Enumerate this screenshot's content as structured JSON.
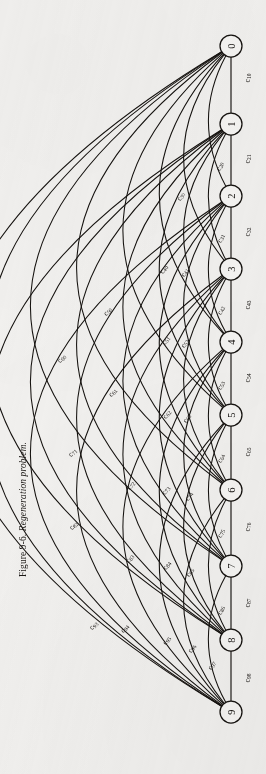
{
  "figure": {
    "caption_number": "Figure 9-6.",
    "caption_title": "Regeneration problem.",
    "type": "undirected-complete-graph",
    "node_count": 10,
    "edge_count": 45
  },
  "nodes": [
    {
      "id": "0",
      "label": "0",
      "x": 231,
      "y": 46
    },
    {
      "id": "1",
      "label": "1",
      "x": 231,
      "y": 124
    },
    {
      "id": "2",
      "label": "2",
      "x": 231,
      "y": 196
    },
    {
      "id": "3",
      "label": "3",
      "x": 231,
      "y": 269
    },
    {
      "id": "4",
      "label": "4",
      "x": 231,
      "y": 342
    },
    {
      "id": "5",
      "label": "5",
      "x": 231,
      "y": 415
    },
    {
      "id": "6",
      "label": "6",
      "x": 231,
      "y": 490
    },
    {
      "id": "7",
      "label": "7",
      "x": 231,
      "y": 566
    },
    {
      "id": "8",
      "label": "8",
      "x": 231,
      "y": 640
    },
    {
      "id": "9",
      "label": "9",
      "x": 231,
      "y": 712
    }
  ],
  "node_radius": 11,
  "edges": [
    {
      "label": "c",
      "sub": "10",
      "from": "1",
      "to": "0",
      "lx": 247,
      "ly": 78,
      "rot": -90,
      "bulge": 0
    },
    {
      "label": "c",
      "sub": "21",
      "from": "2",
      "to": "1",
      "lx": 247,
      "ly": 159,
      "rot": -90,
      "bulge": 0
    },
    {
      "label": "c",
      "sub": "20",
      "from": "2",
      "to": "0",
      "lx": 219,
      "ly": 166,
      "rot": -68,
      "bulge": 20
    },
    {
      "label": "c",
      "sub": "32",
      "from": "3",
      "to": "2",
      "lx": 247,
      "ly": 232,
      "rot": -90,
      "bulge": 0
    },
    {
      "label": "c",
      "sub": "31",
      "from": "3",
      "to": "1",
      "lx": 220,
      "ly": 238,
      "rot": -68,
      "bulge": 20
    },
    {
      "label": "c",
      "sub": "30",
      "from": "3",
      "to": "0",
      "lx": 180,
      "ly": 196,
      "rot": -58,
      "bulge": 44
    },
    {
      "label": "c",
      "sub": "43",
      "from": "4",
      "to": "3",
      "lx": 247,
      "ly": 305,
      "rot": -90,
      "bulge": 0
    },
    {
      "label": "c",
      "sub": "42",
      "from": "4",
      "to": "2",
      "lx": 220,
      "ly": 310,
      "rot": -68,
      "bulge": 20
    },
    {
      "label": "c",
      "sub": "41",
      "from": "4",
      "to": "1",
      "lx": 184,
      "ly": 272,
      "rot": -60,
      "bulge": 44
    },
    {
      "label": "c",
      "sub": "40",
      "from": "4",
      "to": "0",
      "lx": 163,
      "ly": 269,
      "rot": -56,
      "bulge": 68
    },
    {
      "label": "c",
      "sub": "54",
      "from": "5",
      "to": "4",
      "lx": 247,
      "ly": 378,
      "rot": -90,
      "bulge": 0
    },
    {
      "label": "c",
      "sub": "53",
      "from": "5",
      "to": "3",
      "lx": 220,
      "ly": 385,
      "rot": -68,
      "bulge": 20
    },
    {
      "label": "c",
      "sub": "52",
      "from": "5",
      "to": "2",
      "lx": 184,
      "ly": 343,
      "rot": -60,
      "bulge": 44
    },
    {
      "label": "c",
      "sub": "51",
      "from": "5",
      "to": "1",
      "lx": 165,
      "ly": 340,
      "rot": -56,
      "bulge": 68
    },
    {
      "label": "c",
      "sub": "50",
      "from": "5",
      "to": "0",
      "lx": 107,
      "ly": 311,
      "rot": -50,
      "bulge": 104
    },
    {
      "label": "c",
      "sub": "65",
      "from": "6",
      "to": "5",
      "lx": 247,
      "ly": 452,
      "rot": -90,
      "bulge": 0
    },
    {
      "label": "c",
      "sub": "64",
      "from": "6",
      "to": "4",
      "lx": 220,
      "ly": 458,
      "rot": -68,
      "bulge": 20
    },
    {
      "label": "c",
      "sub": "63",
      "from": "6",
      "to": "3",
      "lx": 186,
      "ly": 418,
      "rot": -60,
      "bulge": 44
    },
    {
      "label": "c",
      "sub": "62",
      "from": "6",
      "to": "2",
      "lx": 166,
      "ly": 414,
      "rot": -56,
      "bulge": 68
    },
    {
      "label": "c",
      "sub": "61",
      "from": "6",
      "to": "1",
      "lx": 112,
      "ly": 392,
      "rot": -50,
      "bulge": 104
    },
    {
      "label": "c",
      "sub": "60",
      "from": "6",
      "to": "0",
      "lx": 61,
      "ly": 358,
      "rot": -46,
      "bulge": 150
    },
    {
      "label": "c",
      "sub": "76",
      "from": "7",
      "to": "6",
      "lx": 247,
      "ly": 527,
      "rot": -90,
      "bulge": 0
    },
    {
      "label": "c",
      "sub": "75",
      "from": "7",
      "to": "5",
      "lx": 220,
      "ly": 533,
      "rot": -68,
      "bulge": 20
    },
    {
      "label": "c",
      "sub": "74",
      "from": "7",
      "to": "4",
      "lx": 188,
      "ly": 496,
      "rot": -60,
      "bulge": 44
    },
    {
      "label": "c",
      "sub": "73",
      "from": "7",
      "to": "3",
      "lx": 165,
      "ly": 490,
      "rot": -56,
      "bulge": 68
    },
    {
      "label": "c",
      "sub": "72",
      "from": "7",
      "to": "2",
      "lx": 130,
      "ly": 485,
      "rot": -52,
      "bulge": 104
    },
    {
      "label": "c",
      "sub": "71",
      "from": "7",
      "to": "1",
      "lx": 72,
      "ly": 452,
      "rot": -46,
      "bulge": 150
    },
    {
      "label": "c",
      "sub": "87",
      "from": "8",
      "to": "7",
      "lx": 247,
      "ly": 603,
      "rot": -90,
      "bulge": 0
    },
    {
      "label": "c",
      "sub": "86",
      "from": "8",
      "to": "6",
      "lx": 220,
      "ly": 610,
      "rot": -68,
      "bulge": 20
    },
    {
      "label": "c",
      "sub": "85",
      "from": "8",
      "to": "5",
      "lx": 189,
      "ly": 572,
      "rot": -60,
      "bulge": 44
    },
    {
      "label": "c",
      "sub": "84",
      "from": "8",
      "to": "4",
      "lx": 166,
      "ly": 565,
      "rot": -56,
      "bulge": 68
    },
    {
      "label": "c",
      "sub": "83",
      "from": "8",
      "to": "3",
      "lx": 129,
      "ly": 558,
      "rot": -52,
      "bulge": 104
    },
    {
      "label": "c",
      "sub": "82",
      "from": "8",
      "to": "2",
      "lx": 73,
      "ly": 525,
      "rot": -46,
      "bulge": 150
    },
    {
      "label": "c",
      "sub": "98",
      "from": "9",
      "to": "8",
      "lx": 247,
      "ly": 678,
      "rot": -90,
      "bulge": 0
    },
    {
      "label": "c",
      "sub": "97",
      "from": "9",
      "to": "7",
      "lx": 211,
      "ly": 665,
      "rot": -62,
      "bulge": 20
    },
    {
      "label": "c",
      "sub": "96",
      "from": "9",
      "to": "6",
      "lx": 191,
      "ly": 648,
      "rot": -58,
      "bulge": 44
    },
    {
      "label": "c",
      "sub": "95",
      "from": "9",
      "to": "5",
      "lx": 166,
      "ly": 640,
      "rot": -54,
      "bulge": 68
    },
    {
      "label": "c",
      "sub": "94",
      "from": "9",
      "to": "4",
      "lx": 124,
      "ly": 628,
      "rot": -50,
      "bulge": 104
    },
    {
      "label": "c",
      "sub": "93",
      "from": "9",
      "to": "3",
      "lx": 93,
      "ly": 625,
      "rot": -46,
      "bulge": 150
    }
  ],
  "unlabeled_edges": [
    {
      "from": "8",
      "to": "1",
      "bulge": 196
    },
    {
      "from": "8",
      "to": "0",
      "bulge": 238
    },
    {
      "from": "9",
      "to": "2",
      "bulge": 196
    },
    {
      "from": "9",
      "to": "1",
      "bulge": 238
    },
    {
      "from": "9",
      "to": "0",
      "bulge": 276
    },
    {
      "from": "7",
      "to": "0",
      "bulge": 196
    }
  ],
  "colors": {
    "paper": "#f3f2f0",
    "ink": "#15120f",
    "node_fill": "#f7f6f4"
  }
}
